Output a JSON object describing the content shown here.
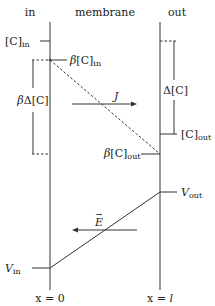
{
  "headers": {
    "in": "in",
    "membrane": "membrane",
    "out": "out"
  },
  "concentration": {
    "c_in": "[C]",
    "c_in_sub": "in",
    "beta_c_in_beta": "β",
    "beta_c_in": "[C]",
    "beta_c_in_sub": "in",
    "beta_delta_c_beta": "β",
    "beta_delta_c": "Δ[C]",
    "delta_c": "Δ[C]",
    "c_out": "[C]",
    "c_out_sub": "out",
    "beta_c_out_beta": "β",
    "beta_c_out": "[C]",
    "beta_c_out_sub": "out",
    "flux": "J"
  },
  "potential": {
    "v_out": "V",
    "v_out_sub": "out",
    "v_in": "V",
    "v_in_sub": "in",
    "field": "E",
    "field_arrow": "→"
  },
  "positions": {
    "x0": "x = 0",
    "xl_prefix": "x = ",
    "xl_var": "l"
  },
  "colors": {
    "line": "#333333",
    "text": "#222222",
    "background": "#ffffff"
  }
}
